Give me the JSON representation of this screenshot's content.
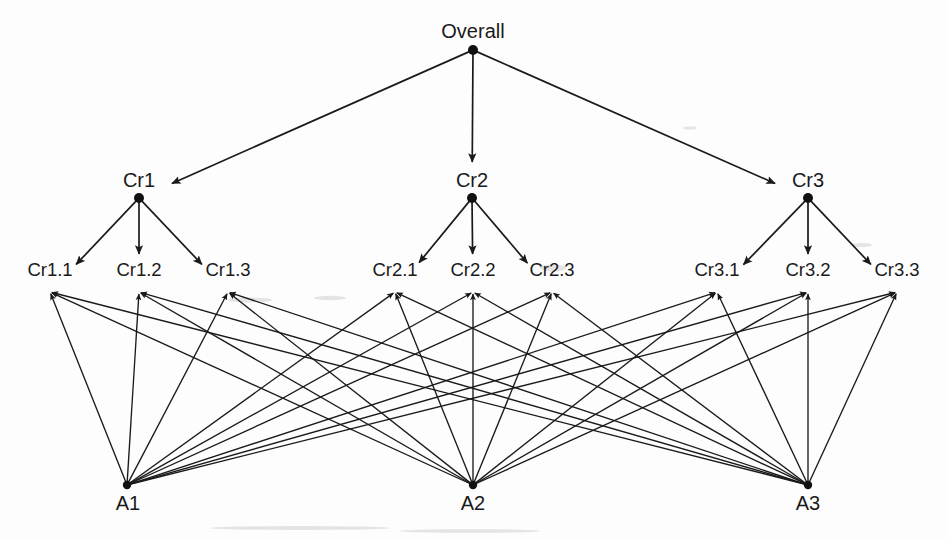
{
  "diagram": {
    "type": "hierarchy-tree",
    "levels": [
      {
        "name": "goal",
        "label": "Goal",
        "nodes": [
          {
            "id": "overall",
            "label": "Overall",
            "x": 473,
            "y": 50,
            "label_x": 473,
            "label_y": 38
          }
        ]
      },
      {
        "name": "criteria",
        "label": "Criteria",
        "nodes": [
          {
            "id": "cr1",
            "label": "Cr1",
            "x": 139,
            "y": 198,
            "label_x": 139,
            "label_y": 187
          },
          {
            "id": "cr2",
            "label": "Cr2",
            "x": 472,
            "y": 198,
            "label_x": 472,
            "label_y": 187
          },
          {
            "id": "cr3",
            "label": "Cr3",
            "x": 808,
            "y": 198,
            "label_x": 808,
            "label_y": 187
          }
        ]
      },
      {
        "name": "subcriteria",
        "label": "Sub-criteria",
        "nodes": [
          {
            "id": "cr11",
            "label": "Cr1.1",
            "x": 50,
            "y": 292,
            "label_x": 50,
            "label_y": 276
          },
          {
            "id": "cr12",
            "label": "Cr1.2",
            "x": 139,
            "y": 292,
            "label_x": 139,
            "label_y": 276
          },
          {
            "id": "cr13",
            "label": "Cr1.3",
            "x": 228,
            "y": 292,
            "label_x": 228,
            "label_y": 276
          },
          {
            "id": "cr21",
            "label": "Cr2.1",
            "x": 395,
            "y": 292,
            "label_x": 395,
            "label_y": 276
          },
          {
            "id": "cr22",
            "label": "Cr2.2",
            "x": 473,
            "y": 292,
            "label_x": 473,
            "label_y": 276
          },
          {
            "id": "cr23",
            "label": "Cr2.3",
            "x": 552,
            "y": 292,
            "label_x": 552,
            "label_y": 276
          },
          {
            "id": "cr31",
            "label": "Cr3.1",
            "x": 717,
            "y": 292,
            "label_x": 717,
            "label_y": 276
          },
          {
            "id": "cr32",
            "label": "Cr3.2",
            "x": 808,
            "y": 292,
            "label_x": 808,
            "label_y": 276
          },
          {
            "id": "cr33",
            "label": "Cr3.3",
            "x": 897,
            "y": 292,
            "label_x": 897,
            "label_y": 276
          }
        ]
      },
      {
        "name": "alternatives",
        "label": "Alternatives",
        "nodes": [
          {
            "id": "a1",
            "label": "A1",
            "x": 127,
            "y": 485,
            "label_x": 128,
            "label_y": 510
          },
          {
            "id": "a2",
            "label": "A2",
            "x": 473,
            "y": 485,
            "label_x": 473,
            "label_y": 510
          },
          {
            "id": "a3",
            "label": "A3",
            "x": 808,
            "y": 485,
            "label_x": 808,
            "label_y": 510
          }
        ]
      }
    ],
    "edges": {
      "goal_to_criteria": [
        {
          "from": "overall",
          "to": "cr1"
        },
        {
          "from": "overall",
          "to": "cr2"
        },
        {
          "from": "overall",
          "to": "cr3"
        }
      ],
      "criteria_to_subcriteria": [
        {
          "from": "cr1",
          "to": "cr11"
        },
        {
          "from": "cr1",
          "to": "cr12"
        },
        {
          "from": "cr1",
          "to": "cr13"
        },
        {
          "from": "cr2",
          "to": "cr21"
        },
        {
          "from": "cr2",
          "to": "cr22"
        },
        {
          "from": "cr2",
          "to": "cr23"
        },
        {
          "from": "cr3",
          "to": "cr31"
        },
        {
          "from": "cr3",
          "to": "cr32"
        },
        {
          "from": "cr3",
          "to": "cr33"
        }
      ],
      "alternatives_to_subcriteria": [
        {
          "from": "a1",
          "to": "cr11"
        },
        {
          "from": "a1",
          "to": "cr12"
        },
        {
          "from": "a1",
          "to": "cr13"
        },
        {
          "from": "a1",
          "to": "cr21"
        },
        {
          "from": "a1",
          "to": "cr22"
        },
        {
          "from": "a1",
          "to": "cr23"
        },
        {
          "from": "a1",
          "to": "cr31"
        },
        {
          "from": "a1",
          "to": "cr32"
        },
        {
          "from": "a1",
          "to": "cr33"
        },
        {
          "from": "a2",
          "to": "cr11"
        },
        {
          "from": "a2",
          "to": "cr12"
        },
        {
          "from": "a2",
          "to": "cr13"
        },
        {
          "from": "a2",
          "to": "cr21"
        },
        {
          "from": "a2",
          "to": "cr22"
        },
        {
          "from": "a2",
          "to": "cr23"
        },
        {
          "from": "a2",
          "to": "cr31"
        },
        {
          "from": "a2",
          "to": "cr32"
        },
        {
          "from": "a2",
          "to": "cr33"
        },
        {
          "from": "a3",
          "to": "cr11"
        },
        {
          "from": "a3",
          "to": "cr12"
        },
        {
          "from": "a3",
          "to": "cr13"
        },
        {
          "from": "a3",
          "to": "cr21"
        },
        {
          "from": "a3",
          "to": "cr22"
        },
        {
          "from": "a3",
          "to": "cr23"
        },
        {
          "from": "a3",
          "to": "cr31"
        },
        {
          "from": "a3",
          "to": "cr32"
        },
        {
          "from": "a3",
          "to": "cr33"
        }
      ]
    },
    "style": {
      "line_color": "#1a1a1a",
      "node_color": "#111111",
      "text_color": "#1a1a1a",
      "background": "#fdfdfd"
    }
  }
}
